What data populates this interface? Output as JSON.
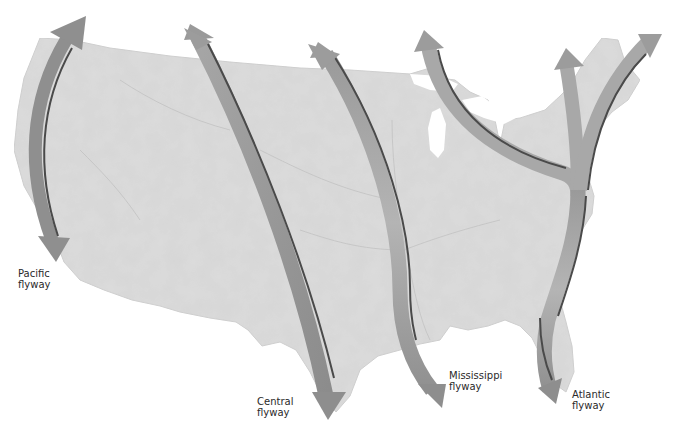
{
  "map": {
    "title": "North American migratory bird flyways",
    "region": "Contiguous United States",
    "colors": {
      "land": "#dcdcdc",
      "land_shade": "#cfcfcf",
      "rivers": "#bdbdbd",
      "arrow_light": "#b2b2b2",
      "arrow_dark": "#8e8e8e",
      "arrow_shadow": "#4a4a4a",
      "label_text": "#2a2a2a",
      "background": "#ffffff"
    }
  },
  "flyways": [
    {
      "id": "pacific",
      "line1": "Pacific",
      "line2": "flyway",
      "direction": "bidirectional north-south"
    },
    {
      "id": "central",
      "line1": "Central",
      "line2": "flyway",
      "direction": "bidirectional north-south"
    },
    {
      "id": "mississippi",
      "line1": "Mississippi",
      "line2": "flyway",
      "direction": "bidirectional north-south"
    },
    {
      "id": "atlantic",
      "line1": "Atlantic",
      "line2": "flyway",
      "direction": "branching north, south"
    }
  ]
}
